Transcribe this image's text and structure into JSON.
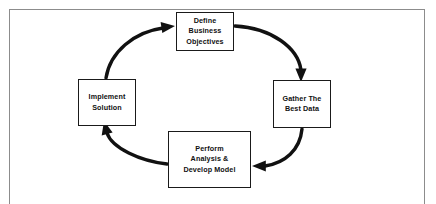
{
  "diagram": {
    "type": "cyclical-process",
    "direction": "clockwise",
    "frame": {
      "border_color": "#8c8c8c",
      "background_color": "#ffffff"
    },
    "style": {
      "node_border_color": "#1a1a1a",
      "node_fill_color": "#ffffff",
      "text_color": "#111111",
      "arrow_color": "#111111"
    },
    "nodes": [
      {
        "id": "define",
        "position": "top",
        "lines": [
          "Define",
          "Business",
          "Objectives"
        ]
      },
      {
        "id": "gather",
        "position": "right",
        "lines": [
          "Gather The",
          "Best Data"
        ]
      },
      {
        "id": "perform",
        "position": "bottom",
        "lines": [
          "Perform",
          "Analysis &",
          "Develop Model"
        ]
      },
      {
        "id": "implement",
        "position": "left",
        "lines": [
          "Implement",
          "Solution"
        ]
      }
    ],
    "arrows": [
      {
        "id": "define-to-gather",
        "from": "define",
        "to": "gather"
      },
      {
        "id": "gather-to-perform",
        "from": "gather",
        "to": "perform"
      },
      {
        "id": "perform-to-implement",
        "from": "perform",
        "to": "implement"
      },
      {
        "id": "implement-to-define",
        "from": "implement",
        "to": "define"
      }
    ]
  }
}
